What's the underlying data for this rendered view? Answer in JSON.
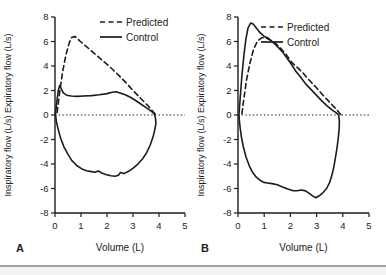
{
  "figure": {
    "background": "#ffffff",
    "line_color": "#1c1c1c",
    "text_color": "#222222",
    "divider_color": "#9aa0a4",
    "strip_color": "#f2f2f2"
  },
  "chart_data": [
    {
      "type": "line",
      "panel_label": "A",
      "title": "",
      "xlabel": "Volume (L)",
      "ylabel": "Inspiratory flow (L/s) Expiratory flow (L/s)",
      "xlim": [
        0,
        5
      ],
      "ylim": [
        -8,
        8
      ],
      "xticks": [
        0,
        1,
        2,
        3,
        4,
        5
      ],
      "yticks": [
        -8,
        -6,
        -4,
        -2,
        0,
        2,
        4,
        6,
        8
      ],
      "grid": false,
      "zero_line": "dotted",
      "legend_position": "upper-right-inside",
      "legend": [
        {
          "label": "Predicted",
          "style": "dashed"
        },
        {
          "label": "Control",
          "style": "solid"
        }
      ],
      "series": [
        {
          "name": "Predicted",
          "style": "dashed",
          "closed": false,
          "points": [
            [
              0.08,
              0.2
            ],
            [
              0.2,
              2.2
            ],
            [
              0.3,
              3.6
            ],
            [
              0.42,
              4.9
            ],
            [
              0.55,
              5.9
            ],
            [
              0.65,
              6.35
            ],
            [
              0.78,
              6.4
            ],
            [
              0.95,
              6.05
            ],
            [
              1.2,
              5.6
            ],
            [
              1.5,
              5.05
            ],
            [
              1.8,
              4.5
            ],
            [
              2.1,
              3.95
            ],
            [
              2.4,
              3.35
            ],
            [
              2.7,
              2.7
            ],
            [
              3.0,
              2.0
            ],
            [
              3.3,
              1.35
            ],
            [
              3.6,
              0.7
            ],
            [
              3.8,
              0.2
            ],
            [
              3.88,
              0
            ]
          ]
        },
        {
          "name": "Control",
          "style": "solid",
          "closed": true,
          "points": [
            [
              0.02,
              0.1
            ],
            [
              0.07,
              1.1
            ],
            [
              0.13,
              2.05
            ],
            [
              0.18,
              2.4
            ],
            [
              0.24,
              2.15
            ],
            [
              0.32,
              1.8
            ],
            [
              0.45,
              1.62
            ],
            [
              0.62,
              1.55
            ],
            [
              0.85,
              1.52
            ],
            [
              1.1,
              1.55
            ],
            [
              1.4,
              1.58
            ],
            [
              1.7,
              1.65
            ],
            [
              2.0,
              1.75
            ],
            [
              2.2,
              1.85
            ],
            [
              2.35,
              1.9
            ],
            [
              2.5,
              1.8
            ],
            [
              2.7,
              1.65
            ],
            [
              2.9,
              1.45
            ],
            [
              3.1,
              1.18
            ],
            [
              3.3,
              0.9
            ],
            [
              3.5,
              0.6
            ],
            [
              3.7,
              0.32
            ],
            [
              3.82,
              0.1
            ],
            [
              3.87,
              -0.3
            ],
            [
              3.88,
              -0.7
            ],
            [
              3.84,
              -1.2
            ],
            [
              3.77,
              -1.8
            ],
            [
              3.66,
              -2.45
            ],
            [
              3.53,
              -3.05
            ],
            [
              3.38,
              -3.55
            ],
            [
              3.2,
              -3.98
            ],
            [
              3.02,
              -4.32
            ],
            [
              2.83,
              -4.6
            ],
            [
              2.65,
              -4.78
            ],
            [
              2.52,
              -4.7
            ],
            [
              2.44,
              -4.92
            ],
            [
              2.32,
              -5.0
            ],
            [
              2.15,
              -4.96
            ],
            [
              1.95,
              -4.85
            ],
            [
              1.78,
              -4.72
            ],
            [
              1.66,
              -4.56
            ],
            [
              1.54,
              -4.68
            ],
            [
              1.4,
              -4.62
            ],
            [
              1.22,
              -4.55
            ],
            [
              1.03,
              -4.4
            ],
            [
              0.84,
              -4.12
            ],
            [
              0.65,
              -3.72
            ],
            [
              0.5,
              -3.22
            ],
            [
              0.35,
              -2.62
            ],
            [
              0.22,
              -1.92
            ],
            [
              0.12,
              -1.15
            ],
            [
              0.05,
              -0.5
            ]
          ]
        }
      ]
    },
    {
      "type": "line",
      "panel_label": "B",
      "title": "",
      "xlabel": "Volume (L)",
      "ylabel": "Inspiratory flow (L/s) Expiratory flow (L/s)",
      "xlim": [
        0,
        5
      ],
      "ylim": [
        -8,
        8
      ],
      "xticks": [
        0,
        1,
        2,
        3,
        4,
        5
      ],
      "yticks": [
        -8,
        -6,
        -4,
        -2,
        0,
        2,
        4,
        6,
        8
      ],
      "grid": false,
      "zero_line": "dotted",
      "legend_position": "upper-right-inside",
      "legend": [
        {
          "label": "Predicted",
          "style": "dashed"
        },
        {
          "label": "Control",
          "style": "solid"
        }
      ],
      "series": [
        {
          "name": "Predicted",
          "style": "dashed",
          "closed": false,
          "points": [
            [
              0.15,
              0.1
            ],
            [
              0.22,
              1.3
            ],
            [
              0.32,
              2.8
            ],
            [
              0.45,
              4.2
            ],
            [
              0.6,
              5.4
            ],
            [
              0.75,
              6.05
            ],
            [
              0.9,
              6.3
            ],
            [
              1.05,
              6.3
            ],
            [
              1.25,
              6.1
            ],
            [
              1.45,
              5.8
            ],
            [
              1.65,
              5.4
            ],
            [
              1.85,
              4.9
            ],
            [
              2.05,
              4.3
            ],
            [
              2.25,
              3.9
            ],
            [
              2.45,
              3.5
            ],
            [
              2.65,
              3.0
            ],
            [
              2.85,
              2.55
            ],
            [
              3.05,
              2.1
            ],
            [
              3.25,
              1.6
            ],
            [
              3.45,
              1.15
            ],
            [
              3.65,
              0.7
            ],
            [
              3.8,
              0.35
            ],
            [
              3.92,
              0.05
            ]
          ]
        },
        {
          "name": "Control",
          "style": "solid",
          "closed": true,
          "points": [
            [
              0.04,
              0.1
            ],
            [
              0.09,
              1.6
            ],
            [
              0.15,
              3.2
            ],
            [
              0.22,
              4.8
            ],
            [
              0.3,
              6.2
            ],
            [
              0.38,
              7.1
            ],
            [
              0.48,
              7.5
            ],
            [
              0.58,
              7.42
            ],
            [
              0.7,
              7.1
            ],
            [
              0.85,
              6.7
            ],
            [
              1.0,
              6.42
            ],
            [
              1.15,
              6.28
            ],
            [
              1.3,
              6.0
            ],
            [
              1.5,
              5.6
            ],
            [
              1.7,
              5.15
            ],
            [
              1.9,
              4.55
            ],
            [
              2.05,
              4.1
            ],
            [
              2.2,
              3.6
            ],
            [
              2.4,
              3.05
            ],
            [
              2.6,
              2.5
            ],
            [
              2.8,
              2.05
            ],
            [
              3.0,
              1.6
            ],
            [
              3.2,
              1.15
            ],
            [
              3.4,
              0.75
            ],
            [
              3.6,
              0.4
            ],
            [
              3.75,
              0.18
            ],
            [
              3.84,
              0.02
            ],
            [
              3.87,
              -0.5
            ],
            [
              3.86,
              -1.2
            ],
            [
              3.82,
              -2.0
            ],
            [
              3.77,
              -2.8
            ],
            [
              3.71,
              -3.6
            ],
            [
              3.66,
              -4.2
            ],
            [
              3.6,
              -4.8
            ],
            [
              3.5,
              -5.5
            ],
            [
              3.38,
              -6.0
            ],
            [
              3.24,
              -6.35
            ],
            [
              3.1,
              -6.6
            ],
            [
              2.97,
              -6.75
            ],
            [
              2.86,
              -6.62
            ],
            [
              2.72,
              -6.4
            ],
            [
              2.58,
              -6.2
            ],
            [
              2.42,
              -6.12
            ],
            [
              2.25,
              -6.18
            ],
            [
              2.08,
              -6.17
            ],
            [
              1.9,
              -6.05
            ],
            [
              1.7,
              -5.88
            ],
            [
              1.5,
              -5.7
            ],
            [
              1.3,
              -5.6
            ],
            [
              1.13,
              -5.55
            ],
            [
              0.98,
              -5.5
            ],
            [
              0.84,
              -5.32
            ],
            [
              0.7,
              -5.08
            ],
            [
              0.56,
              -4.7
            ],
            [
              0.43,
              -4.15
            ],
            [
              0.31,
              -3.45
            ],
            [
              0.21,
              -2.65
            ],
            [
              0.13,
              -1.8
            ],
            [
              0.08,
              -1.0
            ],
            [
              0.05,
              -0.4
            ]
          ]
        }
      ]
    }
  ]
}
